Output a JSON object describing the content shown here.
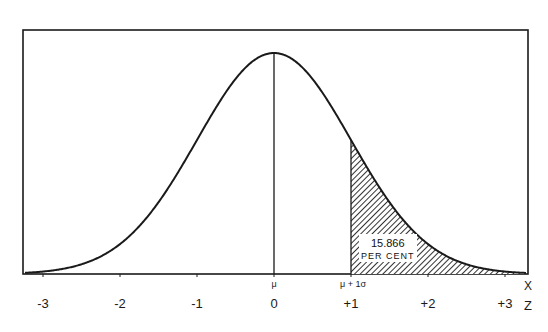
{
  "figure": {
    "type": "normal-distribution-diagram",
    "frame": {
      "left": 23,
      "top": 30,
      "right": 528,
      "bottom": 274
    },
    "mu_px": 274,
    "sigma_px": 77,
    "peak_y": 53,
    "baseline_y": 274,
    "shaded_from_z": 1,
    "line_color": "#1a1a1a",
    "hatch_color": "#333333"
  },
  "labels": {
    "mu": "μ",
    "mu_plus_sigma": "μ + 1σ",
    "x_axis_name": "X",
    "z_axis_name": "Z",
    "area_value": "15.866",
    "area_unit": "PER CENT"
  },
  "z_ticks": [
    {
      "z": -3,
      "label": "-3"
    },
    {
      "z": -2,
      "label": "-2"
    },
    {
      "z": -1,
      "label": "-1"
    },
    {
      "z": 0,
      "label": "0"
    },
    {
      "z": 1,
      "label": "+1"
    },
    {
      "z": 2,
      "label": "+2"
    },
    {
      "z": 3,
      "label": "+3"
    }
  ],
  "chart_data": {
    "type": "area",
    "title": "",
    "xlabel": "Z",
    "x_secondary_label": "X",
    "x_ticks": [
      -3,
      -2,
      -1,
      0,
      1,
      2,
      3
    ],
    "x_tick_labels": [
      "-3",
      "-2",
      "-1",
      "0",
      "+1",
      "+2",
      "+3"
    ],
    "xlim": [
      -3.3,
      3.3
    ],
    "annotations": [
      {
        "x": 0,
        "text": "μ"
      },
      {
        "x": 1,
        "text": "μ + 1σ"
      },
      {
        "region": [
          1,
          3.3
        ],
        "text": "15.866 PER CENT",
        "shaded": true
      }
    ],
    "shaded_area_percent": 15.866,
    "grid": false
  }
}
